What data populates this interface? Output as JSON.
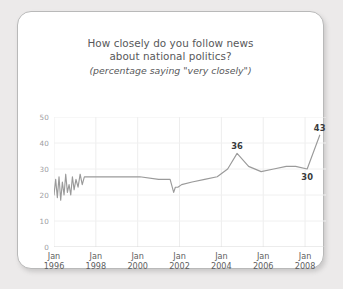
{
  "card": {
    "title_line1": "How closely do you follow news",
    "title_line2": "about national politics?",
    "subtitle": "(percentage saying \"very closely\")"
  },
  "chart_data": {
    "type": "line",
    "title": "How closely do you follow news about national politics?",
    "subtitle": "(percentage saying \"very closely\")",
    "xlabel": "",
    "ylabel": "",
    "ylim": [
      0,
      50
    ],
    "yticks": [
      0,
      10,
      20,
      30,
      40,
      50
    ],
    "ytick_labels": [
      "0",
      "10",
      "20",
      "30",
      "40",
      "50"
    ],
    "xlim": [
      1996.0,
      2009.0
    ],
    "xticks": [
      1996,
      1998,
      2000,
      2002,
      2004,
      2006,
      2008
    ],
    "xtick_labels": [
      {
        "month": "Jan",
        "year": "1996"
      },
      {
        "month": "Jan",
        "year": "1998"
      },
      {
        "month": "Jan",
        "year": "2000"
      },
      {
        "month": "Jan",
        "year": "2002"
      },
      {
        "month": "Jan",
        "year": "2004"
      },
      {
        "month": "Jan",
        "year": "2006"
      },
      {
        "month": "Jan",
        "year": "2008"
      }
    ],
    "grid": true,
    "legend": "none",
    "line_color": "#9a9a9a",
    "series": [
      {
        "name": "very closely",
        "x": [
          1996.0,
          1996.08,
          1996.16,
          1996.24,
          1996.32,
          1996.4,
          1996.48,
          1996.56,
          1996.64,
          1996.72,
          1996.8,
          1996.88,
          1996.96,
          1997.05,
          1997.15,
          1997.25,
          1997.35,
          1997.45,
          1997.6,
          1997.8,
          1998.3,
          1999.2,
          2000.1,
          2001.0,
          2001.55,
          2001.72,
          2001.8,
          2001.92,
          2002.1,
          2002.6,
          2003.2,
          2003.8,
          2004.3,
          2004.75,
          2005.3,
          2005.9,
          2006.5,
          2007.1,
          2007.55,
          2008.1,
          2008.7
        ],
        "values": [
          20,
          26,
          19,
          27,
          18,
          25,
          20,
          28,
          21,
          24,
          20,
          27,
          22,
          26,
          23,
          28,
          24,
          27,
          27,
          27,
          27,
          27,
          27,
          26,
          26,
          21,
          23,
          23,
          24,
          25,
          26,
          27,
          30,
          36,
          31,
          29,
          30,
          31,
          31,
          30,
          43
        ]
      }
    ],
    "annotations": [
      {
        "label": "36",
        "x": 2004.75,
        "y": 36,
        "position": "above"
      },
      {
        "label": "30",
        "x": 2008.1,
        "y": 30,
        "position": "below"
      },
      {
        "label": "43",
        "x": 2008.7,
        "y": 43,
        "position": "above"
      }
    ]
  }
}
